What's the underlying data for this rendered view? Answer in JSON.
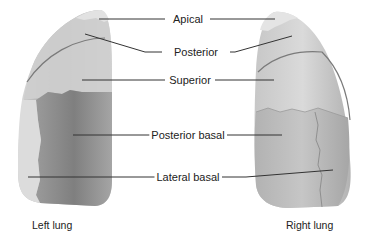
{
  "diagram": {
    "type": "anatomical-illustration",
    "labels": [
      {
        "id": "apical",
        "text": "Apical"
      },
      {
        "id": "posterior",
        "text": "Posterior"
      },
      {
        "id": "superior",
        "text": "Superior"
      },
      {
        "id": "posterior-basal",
        "text": "Posterior basal"
      },
      {
        "id": "lateral-basal",
        "text": "Lateral basal"
      }
    ],
    "captions": {
      "left": "Left lung",
      "right": "Right lung"
    },
    "colors": {
      "lung_light": "#d6d6d6",
      "lung_mid": "#b4b4b4",
      "lung_dark": "#8f8f8f",
      "segment_line": "#6f6f6f",
      "leader_line": "#333333"
    }
  }
}
